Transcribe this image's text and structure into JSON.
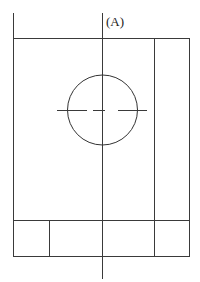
{
  "diagram": {
    "label": "(A)",
    "colors": {
      "line": "#3a3a3a",
      "background": "#ffffff"
    },
    "outer_frame": {
      "x1": 13.5,
      "y_top": 38.5,
      "x2": 189.5,
      "y_bottom": 256.5
    },
    "left_line": {
      "x": 13.5,
      "y1": 13,
      "y2": 256.5
    },
    "center_line": {
      "x": 102.5,
      "y1": 13,
      "y2": 279
    },
    "right_inner_line": {
      "x": 154.5,
      "y1": 38.5,
      "y2": 256.5
    },
    "title_block": {
      "y_top": 220.5,
      "divider_x": 49.5
    },
    "circle": {
      "cx": 102.5,
      "cy": 110,
      "r": 35
    },
    "centerline_dashes": [
      {
        "x1": 57,
        "x2": 87
      },
      {
        "x1": 93,
        "x2": 105
      },
      {
        "x1": 118,
        "x2": 147
      }
    ],
    "centerline_y": 110.5
  }
}
